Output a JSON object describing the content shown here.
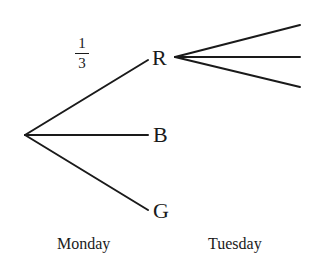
{
  "diagram": {
    "type": "probability-tree",
    "nodes": {
      "R": "R",
      "B": "B",
      "G": "G"
    },
    "branch_probability": {
      "numerator": "1",
      "denominator": "3"
    },
    "stages": {
      "first": "Monday",
      "second": "Tuesday"
    },
    "line_color": "#1a1a1a"
  }
}
